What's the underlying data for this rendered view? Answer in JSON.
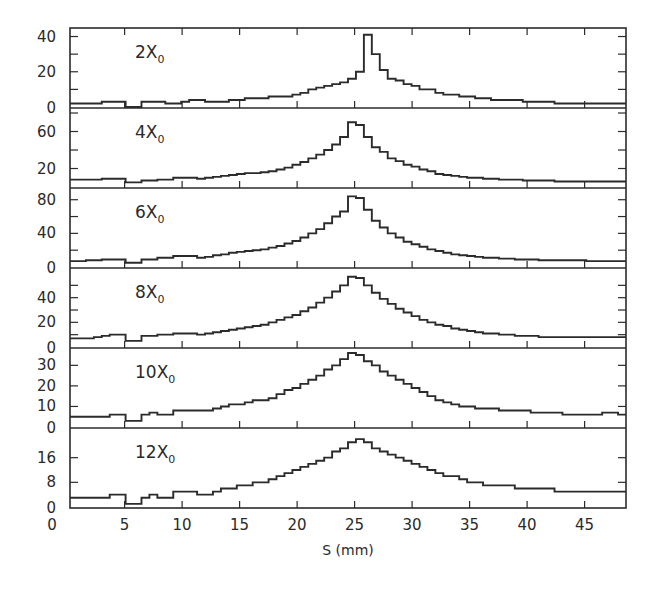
{
  "chart_data": {
    "type": "bar",
    "subtype": "stacked-panels-histogram",
    "xlabel": "S (mm)",
    "xlim": [
      0.25,
      48.6
    ],
    "xticks": [
      0,
      5,
      10,
      15,
      20,
      25,
      30,
      35,
      40,
      45
    ],
    "bin_width": 1,
    "bin_start": 0.25,
    "grid": false,
    "legend": "none",
    "panels": [
      {
        "label": "2X",
        "subscript": "0",
        "ylim": [
          0,
          42
        ],
        "yticks_labeled": [
          0,
          20,
          40
        ],
        "yticks_minor": [
          10,
          30
        ],
        "values": [
          2,
          2,
          2,
          2,
          3,
          3,
          3,
          0,
          0,
          3,
          3,
          3,
          2,
          2,
          3,
          4,
          4,
          3,
          3,
          3,
          4,
          4,
          5,
          5,
          5,
          6,
          6,
          6,
          7,
          8,
          10,
          11,
          12,
          13,
          14,
          16,
          20,
          41,
          30,
          21,
          16,
          15,
          13,
          12,
          10,
          10,
          8,
          7,
          7,
          6,
          6,
          5,
          5,
          4,
          4,
          4,
          4,
          3,
          3,
          3,
          3,
          2,
          2,
          2,
          2,
          2,
          2,
          2,
          2,
          2
        ]
      },
      {
        "label": "4X",
        "subscript": "0",
        "ylim": [
          0,
          80
        ],
        "yticks_labeled": [
          20,
          60
        ],
        "yticks_minor": [
          40,
          80
        ],
        "values": [
          8,
          8,
          8,
          8,
          9,
          9,
          9,
          5,
          5,
          7,
          7,
          8,
          8,
          10,
          10,
          10,
          9,
          10,
          11,
          12,
          13,
          14,
          15,
          15,
          16,
          17,
          19,
          21,
          24,
          27,
          31,
          35,
          40,
          46,
          54,
          70,
          67,
          54,
          43,
          38,
          31,
          28,
          24,
          22,
          19,
          17,
          14,
          13,
          12,
          11,
          10,
          10,
          9,
          9,
          8,
          8,
          8,
          7,
          7,
          7,
          7,
          6,
          6,
          6,
          6,
          6,
          6,
          6,
          6,
          6
        ]
      },
      {
        "label": "6X",
        "subscript": "0",
        "ylim": [
          0,
          88
        ],
        "yticks_labeled": [
          0,
          40,
          80
        ],
        "yticks_minor": [
          20,
          60
        ],
        "values": [
          7,
          7,
          8,
          8,
          9,
          9,
          9,
          5,
          5,
          9,
          9,
          11,
          11,
          13,
          13,
          13,
          11,
          12,
          14,
          15,
          17,
          18,
          19,
          20,
          21,
          23,
          25,
          28,
          31,
          35,
          40,
          45,
          52,
          60,
          66,
          84,
          82,
          68,
          55,
          47,
          40,
          35,
          30,
          27,
          24,
          21,
          19,
          17,
          15,
          14,
          13,
          12,
          11,
          11,
          10,
          10,
          9,
          9,
          9,
          8,
          8,
          8,
          8,
          8,
          8,
          7,
          7,
          7,
          7,
          7
        ]
      },
      {
        "label": "8X",
        "subscript": "0",
        "ylim": [
          0,
          60
        ],
        "yticks_labeled": [
          0,
          20,
          40
        ],
        "yticks_minor": [
          10,
          30,
          50
        ],
        "values": [
          7,
          7,
          7,
          8,
          9,
          10,
          10,
          5,
          5,
          9,
          9,
          10,
          10,
          11,
          11,
          11,
          10,
          11,
          12,
          13,
          14,
          15,
          16,
          17,
          18,
          20,
          22,
          24,
          26,
          29,
          32,
          36,
          40,
          45,
          50,
          57,
          56,
          50,
          44,
          39,
          35,
          31,
          28,
          25,
          22,
          20,
          18,
          17,
          15,
          14,
          13,
          12,
          11,
          11,
          10,
          10,
          9,
          9,
          9,
          8,
          8,
          8,
          8,
          8,
          8,
          8,
          8,
          8,
          8,
          8
        ]
      },
      {
        "label": "10X",
        "subscript": "0",
        "ylim": [
          0,
          36
        ],
        "yticks_labeled": [
          0,
          10,
          20,
          30
        ],
        "yticks_minor": [],
        "values": [
          5,
          5,
          5,
          5,
          5,
          6,
          6,
          3,
          3,
          6,
          7,
          6,
          6,
          8,
          8,
          8,
          8,
          8,
          9,
          10,
          11,
          11,
          12,
          13,
          13,
          14,
          16,
          18,
          19,
          21,
          23,
          25,
          28,
          30,
          33,
          36,
          35,
          32,
          30,
          27,
          25,
          23,
          21,
          19,
          17,
          15,
          13,
          12,
          11,
          10,
          10,
          9,
          9,
          9,
          8,
          8,
          8,
          8,
          7,
          7,
          7,
          7,
          6,
          6,
          6,
          6,
          6,
          7,
          7,
          6
        ]
      },
      {
        "label": "12X",
        "subscript": "0",
        "ylim": [
          0,
          24
        ],
        "yticks_labeled": [
          0,
          8,
          16
        ],
        "yticks_minor": [],
        "values": [
          3,
          3,
          3,
          3,
          3,
          4,
          4,
          1,
          1,
          3,
          4,
          3,
          3,
          5,
          5,
          5,
          4,
          4,
          5,
          6,
          6,
          7,
          7,
          8,
          8,
          9,
          10,
          11,
          12,
          13,
          14,
          15,
          16,
          18,
          19,
          21,
          22,
          21,
          19,
          18,
          17,
          16,
          15,
          14,
          13,
          12,
          11,
          10,
          10,
          9,
          8,
          8,
          7,
          7,
          7,
          7,
          6,
          6,
          6,
          6,
          6,
          5,
          5,
          5,
          5,
          5,
          5,
          5,
          5,
          5
        ]
      }
    ]
  }
}
